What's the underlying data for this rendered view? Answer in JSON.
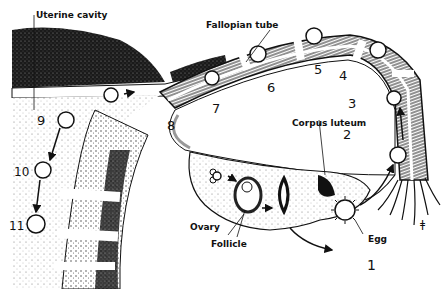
{
  "diagram": {
    "labels": {
      "uterine_cavity": "Uterine cavity",
      "fallopian_tube": "Fallopian tube",
      "corpus_luteum": "Corpus luteum",
      "ovary": "Ovary",
      "follicle": "Follicle",
      "egg": "Egg"
    },
    "stages": [
      {
        "n": "1",
        "x": 367,
        "y": 270
      },
      {
        "n": "2",
        "x": 347,
        "y": 139
      },
      {
        "n": "3",
        "x": 352,
        "y": 108
      },
      {
        "n": "4",
        "x": 343,
        "y": 80
      },
      {
        "n": "5",
        "x": 318,
        "y": 74
      },
      {
        "n": "6",
        "x": 271,
        "y": 90
      },
      {
        "n": "7",
        "x": 216,
        "y": 111
      },
      {
        "n": "8",
        "x": 171,
        "y": 128
      },
      {
        "n": "9",
        "x": 41,
        "y": 123
      },
      {
        "n": "10",
        "x": 16,
        "y": 175
      },
      {
        "n": "11",
        "x": 11,
        "y": 228
      }
    ],
    "signature": "ǂ"
  }
}
